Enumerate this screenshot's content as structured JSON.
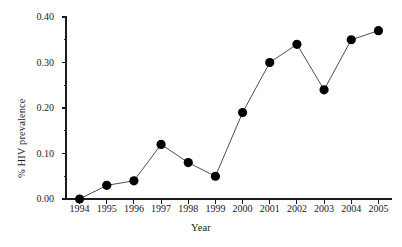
{
  "chart_data": {
    "type": "line",
    "title": "",
    "xlabel": "Year",
    "ylabel": "% HIV prevalence",
    "categories": [
      "1994",
      "1995",
      "1996",
      "1997",
      "1998",
      "1999",
      "2000",
      "2001",
      "2002",
      "2003",
      "2004",
      "2005"
    ],
    "x": [
      1994,
      1995,
      1996,
      1997,
      1998,
      1999,
      2000,
      2001,
      2002,
      2003,
      2004,
      2005
    ],
    "values": [
      0.0,
      0.03,
      0.04,
      0.12,
      0.08,
      0.05,
      0.19,
      0.3,
      0.34,
      0.24,
      0.35,
      0.37
    ],
    "series": [
      {
        "name": "% HIV prevalence",
        "values": [
          0.0,
          0.03,
          0.04,
          0.12,
          0.08,
          0.05,
          0.19,
          0.3,
          0.34,
          0.24,
          0.35,
          0.37
        ]
      }
    ],
    "xlim": [
      1993.5,
      2005.5
    ],
    "ylim": [
      0.0,
      0.4
    ],
    "ytick_values": [
      0.0,
      0.1,
      0.2,
      0.3,
      0.4
    ],
    "ytick_labels": [
      "0.00",
      "0.10",
      "0.20",
      "0.30",
      "0.40"
    ],
    "yminor_tick_values": [
      0.05,
      0.15,
      0.25,
      0.35
    ],
    "xtick_labels": [
      "1994",
      "1995",
      "1996",
      "1997",
      "1998",
      "1999",
      "2000",
      "2001",
      "2002",
      "2003",
      "2004",
      "2005"
    ],
    "grid": false,
    "legend": null,
    "legend_position": "none",
    "marker": "filled-circle",
    "colors": {
      "line": "#3a3a3a",
      "marker": "#000000",
      "axis": "#1a1a1a",
      "background": "#ffffff",
      "text": "#1a1a1a"
    }
  }
}
